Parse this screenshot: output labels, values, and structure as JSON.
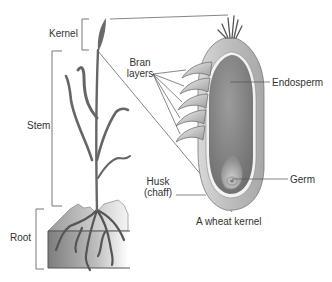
{
  "diagram": {
    "plant_labels": {
      "kernel": "Kernel",
      "stem": "Stem",
      "root": "Root"
    },
    "kernel_labels": {
      "bran_line1": "Bran",
      "bran_line2": "layers",
      "endosperm": "Endosperm",
      "husk_line1": "Husk",
      "husk_line2": "(chaff)",
      "germ": "Germ"
    },
    "caption": "A wheat kernel",
    "colors": {
      "line": "#555555",
      "stalk": "#6a6a6a",
      "endosperm": "#8c8c8c",
      "husk": "#bdbdbd",
      "soil_dark": "#7a7a7a",
      "soil_light": "#f2f2f2"
    }
  }
}
